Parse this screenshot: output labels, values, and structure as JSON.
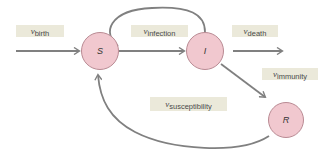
{
  "diagram": {
    "type": "compartment-flow",
    "colors": {
      "node_fill": "#f1c8cf",
      "node_border": "#b98a93",
      "arrow": "#808080",
      "label_bg": "#ebe9da",
      "label_text": "#4a4a4a"
    },
    "nodes": [
      {
        "id": "S",
        "label": "S"
      },
      {
        "id": "I",
        "label": "I"
      },
      {
        "id": "R",
        "label": "R"
      }
    ],
    "labels": {
      "birth": {
        "symbol": "ν",
        "sub": "birth"
      },
      "infection": {
        "symbol": "ν",
        "sub": "infection"
      },
      "death": {
        "symbol": "ν",
        "sub": "death"
      },
      "immunity": {
        "symbol": "ν",
        "sub": "immunity"
      },
      "susceptibility": {
        "symbol": "ν",
        "sub": "susceptibility"
      }
    },
    "edges": [
      {
        "from": "source",
        "to": "S",
        "label": "birth"
      },
      {
        "from": "S",
        "to": "I",
        "label": "infection"
      },
      {
        "from": "S",
        "to": "I",
        "label": "infection-loop"
      },
      {
        "from": "I",
        "to": "sink",
        "label": "death"
      },
      {
        "from": "I",
        "to": "R",
        "label": "immunity"
      },
      {
        "from": "R",
        "to": "S",
        "label": "susceptibility"
      }
    ]
  }
}
